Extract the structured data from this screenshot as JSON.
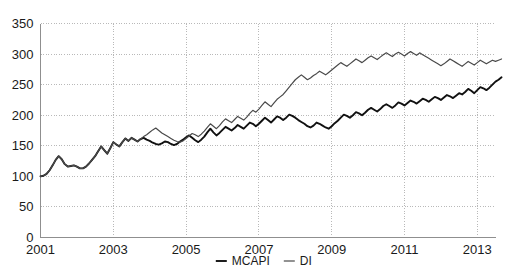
{
  "chart_data": {
    "type": "line",
    "title": "",
    "xlabel": "",
    "ylabel": "",
    "xlim": [
      2001.0,
      2013.5
    ],
    "ylim": [
      0,
      350
    ],
    "grid": true,
    "legend_position": "bottom-center",
    "y_ticks": [
      0,
      50,
      100,
      150,
      200,
      250,
      300,
      350
    ],
    "y_tick_labels": [
      "0",
      "50",
      "100",
      "150",
      "200",
      "250",
      "300",
      "350"
    ],
    "x_ticks": [
      2001,
      2003,
      2005,
      2007,
      2009,
      2011,
      2013
    ],
    "x_tick_labels": [
      "2001",
      "2003",
      "2005",
      "2007",
      "2009",
      "2011",
      "2013"
    ],
    "x_start": 2001.0,
    "x_step": 0.08333,
    "series": [
      {
        "name": "MCAPI",
        "color": "#111111",
        "values": [
          100,
          101,
          104,
          110,
          118,
          127,
          133,
          128,
          120,
          116,
          117,
          118,
          116,
          113,
          113,
          116,
          121,
          127,
          133,
          141,
          149,
          143,
          137,
          146,
          156,
          152,
          149,
          156,
          162,
          158,
          163,
          160,
          157,
          161,
          163,
          160,
          158,
          155,
          153,
          152,
          154,
          157,
          156,
          153,
          151,
          153,
          157,
          160,
          164,
          167,
          163,
          159,
          156,
          160,
          165,
          172,
          178,
          172,
          167,
          171,
          176,
          181,
          178,
          175,
          179,
          184,
          181,
          178,
          183,
          188,
          186,
          182,
          186,
          191,
          196,
          192,
          188,
          193,
          198,
          196,
          192,
          196,
          201,
          199,
          196,
          192,
          189,
          186,
          182,
          180,
          183,
          188,
          186,
          183,
          180,
          178,
          182,
          187,
          191,
          196,
          201,
          199,
          196,
          200,
          205,
          203,
          200,
          204,
          209,
          212,
          209,
          206,
          210,
          215,
          218,
          215,
          212,
          216,
          221,
          219,
          216,
          220,
          224,
          222,
          219,
          223,
          227,
          225,
          222,
          226,
          230,
          228,
          225,
          229,
          233,
          231,
          228,
          232,
          236,
          234,
          238,
          243,
          240,
          236,
          241,
          246,
          244,
          241,
          245,
          250,
          255,
          258,
          262
        ]
      },
      {
        "name": "DI",
        "color": "#4a4a4a",
        "values": [
          100,
          101,
          104,
          110,
          118,
          127,
          133,
          128,
          120,
          116,
          117,
          118,
          116,
          113,
          113,
          116,
          121,
          127,
          133,
          141,
          149,
          143,
          137,
          146,
          156,
          152,
          149,
          156,
          162,
          158,
          163,
          160,
          157,
          161,
          165,
          168,
          172,
          176,
          179,
          175,
          171,
          168,
          165,
          162,
          159,
          157,
          156,
          158,
          162,
          166,
          170,
          168,
          165,
          169,
          174,
          180,
          186,
          182,
          178,
          183,
          189,
          194,
          191,
          188,
          193,
          198,
          195,
          192,
          197,
          203,
          208,
          205,
          210,
          216,
          222,
          218,
          214,
          220,
          226,
          230,
          234,
          240,
          246,
          252,
          258,
          262,
          266,
          262,
          258,
          261,
          265,
          268,
          272,
          269,
          266,
          270,
          274,
          278,
          282,
          286,
          283,
          280,
          284,
          288,
          292,
          289,
          286,
          290,
          294,
          297,
          294,
          291,
          295,
          299,
          302,
          299,
          296,
          300,
          303,
          300,
          297,
          301,
          304,
          301,
          298,
          302,
          299,
          296,
          293,
          290,
          287,
          284,
          281,
          284,
          288,
          292,
          289,
          286,
          283,
          280,
          284,
          288,
          285,
          282,
          286,
          290,
          287,
          284,
          287,
          290,
          288,
          290,
          292
        ]
      }
    ]
  },
  "legend": {
    "items": [
      {
        "label": "MCAPI"
      },
      {
        "label": "DI"
      }
    ]
  }
}
